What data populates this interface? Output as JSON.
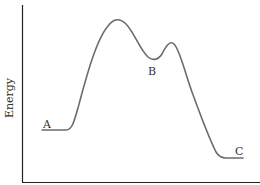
{
  "diagram": {
    "type": "energy-profile",
    "y_axis_label": "Energy",
    "x_axis_label": "",
    "points": {
      "A": "A",
      "B": "B",
      "C": "C"
    },
    "colors": {
      "axis": "#222222",
      "curve": "#6b6b6b",
      "text": "#333333"
    }
  }
}
